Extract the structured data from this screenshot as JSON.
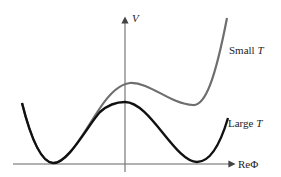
{
  "diagram": {
    "axes": {
      "y_label": "V",
      "x_label": "ReΦ"
    },
    "curves": [
      {
        "name": "small-t",
        "label_text": "Small ",
        "label_var": "T",
        "color": "#6e6e6e"
      },
      {
        "name": "large-t",
        "label_text": "Large ",
        "label_var": "T",
        "color": "#111111"
      }
    ]
  }
}
